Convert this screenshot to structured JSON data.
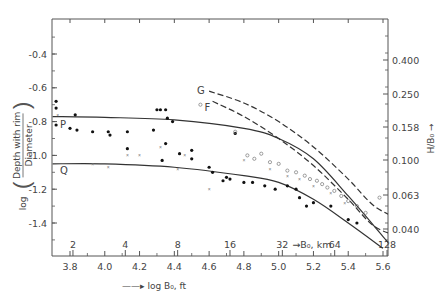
{
  "chart_data": {
    "type": "scatter",
    "title": "",
    "xlabel": "log B0, ft",
    "ylabel": "log (Depth with rim / Diameter)",
    "y2label": "H/B0",
    "xlim": [
      3.7,
      5.7
    ],
    "ylim": [
      -1.6,
      -0.2
    ],
    "x_ticks": [
      "3.8",
      "4.0",
      "4.2",
      "4.4",
      "4.6",
      "4.8",
      "5.0",
      "5.2",
      "5.4",
      "5.6"
    ],
    "y_ticks": [
      "-0.4",
      "-0.6",
      "-0.8",
      "-1.0",
      "-1.2",
      "-1.4"
    ],
    "y2_ticks": [
      "0.400",
      "0.250",
      "0.158",
      "0.100",
      "0.063",
      "0.040"
    ],
    "x2_ticks": [
      "2",
      "4",
      "8",
      "16",
      "32",
      "64",
      "128"
    ],
    "x2_label": "B0, km",
    "grid": false,
    "legend": "none",
    "series": [
      {
        "name": "P",
        "style": "solid",
        "points": [
          [
            3.7,
            -0.77
          ],
          [
            4.0,
            -0.775
          ],
          [
            4.4,
            -0.79
          ],
          [
            4.8,
            -0.84
          ],
          [
            5.0,
            -0.9
          ],
          [
            5.2,
            -1.02
          ],
          [
            5.4,
            -1.24
          ],
          [
            5.6,
            -1.48
          ],
          [
            5.7,
            -1.6
          ]
        ]
      },
      {
        "name": "Q",
        "style": "solid",
        "points": [
          [
            3.7,
            -1.05
          ],
          [
            4.0,
            -1.05
          ],
          [
            4.4,
            -1.07
          ],
          [
            4.8,
            -1.12
          ],
          [
            5.0,
            -1.16
          ],
          [
            5.2,
            -1.26
          ],
          [
            5.4,
            -1.4
          ],
          [
            5.6,
            -1.55
          ]
        ]
      },
      {
        "name": "G",
        "style": "dashed",
        "points": [
          [
            4.6,
            -0.62
          ],
          [
            4.8,
            -0.69
          ],
          [
            5.0,
            -0.8
          ],
          [
            5.2,
            -0.95
          ],
          [
            5.4,
            -1.14
          ],
          [
            5.55,
            -1.3
          ],
          [
            5.7,
            -1.38
          ]
        ]
      },
      {
        "name": "F",
        "style": "dashed",
        "points": [
          [
            4.62,
            -0.68
          ],
          [
            4.8,
            -0.77
          ],
          [
            5.0,
            -0.9
          ],
          [
            5.2,
            -1.06
          ],
          [
            5.4,
            -1.26
          ],
          [
            5.55,
            -1.42
          ],
          [
            5.7,
            -1.48
          ]
        ]
      },
      {
        "name": "fresh craters",
        "marker": "filled-dot",
        "points": [
          [
            3.72,
            -0.68
          ],
          [
            3.72,
            -0.72
          ],
          [
            3.72,
            -0.82
          ],
          [
            3.83,
            -0.76
          ],
          [
            3.8,
            -0.84
          ],
          [
            3.84,
            -0.85
          ],
          [
            3.93,
            -0.86
          ],
          [
            4.02,
            -0.86
          ],
          [
            4.03,
            -0.88
          ],
          [
            4.13,
            -0.86
          ],
          [
            4.13,
            -0.96
          ],
          [
            4.3,
            -0.73
          ],
          [
            4.32,
            -0.73
          ],
          [
            4.35,
            -0.73
          ],
          [
            4.36,
            -0.78
          ],
          [
            4.39,
            -0.8
          ],
          [
            4.28,
            -0.85
          ],
          [
            4.35,
            -0.93
          ],
          [
            4.33,
            -1.03
          ],
          [
            4.43,
            -0.99
          ],
          [
            4.5,
            -0.97
          ],
          [
            4.5,
            -1.02
          ],
          [
            4.6,
            -1.07
          ],
          [
            4.62,
            -1.1
          ],
          [
            4.7,
            -1.13
          ],
          [
            4.72,
            -1.14
          ],
          [
            4.75,
            -0.87
          ],
          [
            4.68,
            -1.15
          ],
          [
            4.8,
            -1.16
          ],
          [
            4.85,
            -1.16
          ],
          [
            4.92,
            -1.18
          ],
          [
            4.98,
            -1.2
          ],
          [
            5.05,
            -1.18
          ],
          [
            5.1,
            -1.2
          ],
          [
            5.12,
            -1.25
          ],
          [
            5.16,
            -1.3
          ],
          [
            5.2,
            -1.28
          ],
          [
            5.3,
            -1.3
          ],
          [
            5.4,
            -1.38
          ],
          [
            5.45,
            -1.4
          ]
        ]
      },
      {
        "name": "degraded craters",
        "marker": "open-circle",
        "points": [
          [
            4.55,
            -0.7
          ],
          [
            4.75,
            -0.86
          ],
          [
            4.82,
            -1.0
          ],
          [
            4.86,
            -1.02
          ],
          [
            4.9,
            -0.99
          ],
          [
            4.95,
            -1.04
          ],
          [
            5.0,
            -1.05
          ],
          [
            5.05,
            -1.09
          ],
          [
            5.1,
            -1.1
          ],
          [
            5.15,
            -1.12
          ],
          [
            5.18,
            -1.14
          ],
          [
            5.22,
            -1.15
          ],
          [
            5.25,
            -1.17
          ],
          [
            5.28,
            -1.19
          ],
          [
            5.32,
            -1.21
          ],
          [
            5.36,
            -1.24
          ],
          [
            5.4,
            -1.27
          ],
          [
            5.45,
            -1.3
          ],
          [
            5.5,
            -1.34
          ],
          [
            5.58,
            -1.25
          ]
        ]
      },
      {
        "name": "other",
        "marker": "x",
        "points": [
          [
            3.73,
            -0.76
          ],
          [
            3.93,
            -1.05
          ],
          [
            4.02,
            -1.07
          ],
          [
            4.13,
            -1.0
          ],
          [
            4.2,
            -1.0
          ],
          [
            4.32,
            -0.95
          ],
          [
            4.46,
            -1.0
          ],
          [
            4.42,
            -1.08
          ],
          [
            4.6,
            -1.2
          ],
          [
            4.8,
            -1.03
          ],
          [
            4.95,
            -1.08
          ],
          [
            5.05,
            -1.12
          ],
          [
            5.12,
            -1.14
          ],
          [
            5.2,
            -1.18
          ],
          [
            5.3,
            -1.22
          ],
          [
            5.38,
            -1.28
          ]
        ]
      }
    ]
  },
  "labels": {
    "curve_P": "P",
    "curve_Q": "Q",
    "curve_G": "G",
    "curve_F": "F",
    "xlabel": "log B₀, ft",
    "xlabel_arrow": "—▸",
    "ylabel_prefix": "log",
    "ylabel_num": "Depth with rim",
    "ylabel_den": "Diameter",
    "y2label": "H/B₀",
    "x2label": "B₀, km"
  }
}
